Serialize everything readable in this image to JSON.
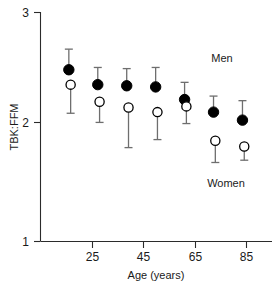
{
  "chart_data": {
    "type": "scatter",
    "title": "",
    "xlabel": "Age (years)",
    "ylabel": "TBK:FFM",
    "xlim": [
      15,
      95
    ],
    "ylim": [
      1,
      3
    ],
    "xticks": [
      25,
      45,
      65,
      85
    ],
    "xtick_labels": [
      "25",
      "45",
      "65",
      "85"
    ],
    "yticks": [
      1,
      2,
      3
    ],
    "ytick_labels": [
      "1",
      "2",
      "3"
    ],
    "grid": false,
    "legend_position": "inside-right",
    "x": [
      25,
      35,
      45,
      55,
      65,
      75,
      85
    ],
    "series": [
      {
        "name": "Men",
        "marker": "filled-circle",
        "color": "#000000",
        "values": [
          2.5,
          2.37,
          2.36,
          2.35,
          2.24,
          2.13,
          2.06
        ],
        "err_high": [
          2.68,
          2.52,
          2.51,
          2.52,
          2.39,
          2.27,
          2.23
        ],
        "err_low": [
          2.12,
          2.04,
          2.06,
          2.1,
          2.03,
          1.96,
          1.93
        ]
      },
      {
        "name": "Women",
        "marker": "open-circle",
        "color": "#ffffff",
        "values": [
          2.37,
          2.22,
          2.17,
          2.13,
          2.18,
          1.88,
          1.83
        ],
        "err_high": [
          2.37,
          2.22,
          2.17,
          2.13,
          2.18,
          1.88,
          1.83
        ],
        "err_low": [
          2.12,
          2.04,
          1.82,
          1.89,
          2.03,
          1.69,
          1.71
        ]
      }
    ],
    "annotations": [
      {
        "text": "Men",
        "x": 84,
        "y": 2.62
      },
      {
        "text": "Women",
        "x": 84,
        "y": 1.54
      }
    ]
  },
  "axes": {
    "y_title": "TBK:FFM",
    "x_title": "Age (years)",
    "y_tick_0": "1",
    "y_tick_1": "2",
    "y_tick_2": "3",
    "x_tick_0": "25",
    "x_tick_1": "45",
    "x_tick_2": "65",
    "x_tick_3": "85"
  },
  "legend": {
    "men_label": "Men",
    "women_label": "Women"
  }
}
